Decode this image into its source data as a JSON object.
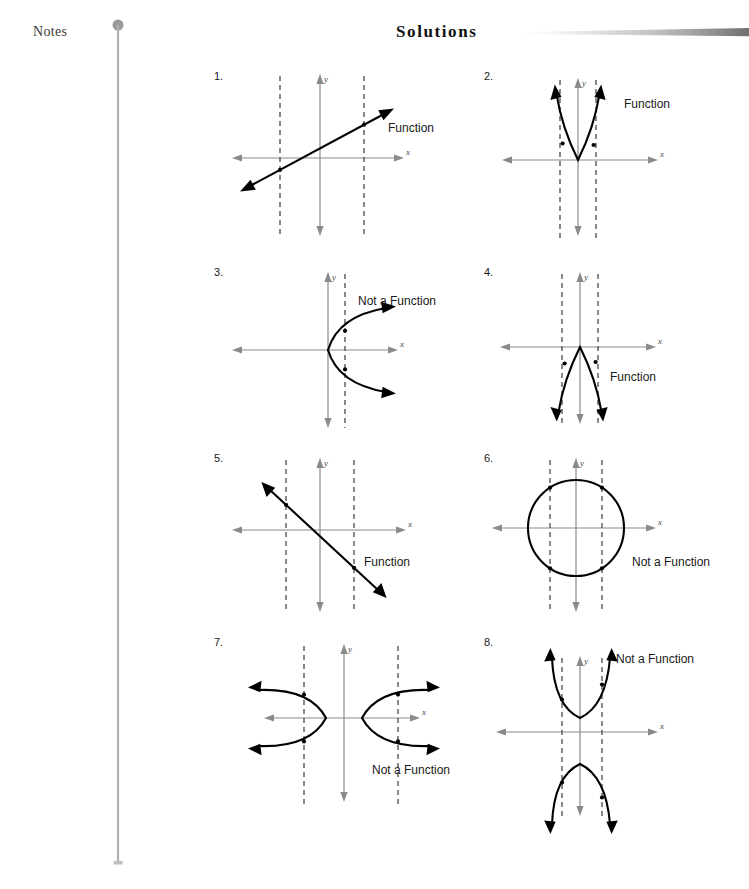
{
  "header": {
    "notes_label": "Notes",
    "title": "Solutions"
  },
  "margin_rule": {
    "color": "#9a9a9a"
  },
  "title_rule": {
    "color": "#8f8f8f"
  },
  "colors": {
    "axis": "#8a8a8a",
    "curve": "#000000",
    "test_line": "#4a4a4a",
    "text": "#1a1a1a"
  },
  "labels": {
    "x_axis": "x",
    "y_axis": "y",
    "function": "Function",
    "not_a_function": "Not a Function"
  },
  "problems": [
    {
      "number": "1.",
      "answer": "Function",
      "graph_type": "line-positive-slope",
      "test_lines": 2,
      "intersections_per_line": 1
    },
    {
      "number": "2.",
      "answer": "Function",
      "graph_type": "parabola-up",
      "test_lines": 2,
      "intersections_per_line": 1
    },
    {
      "number": "3.",
      "answer": "Not a Function",
      "graph_type": "parabola-right",
      "test_lines": 1,
      "intersections_per_line": 2
    },
    {
      "number": "4.",
      "answer": "Function",
      "graph_type": "parabola-down",
      "test_lines": 2,
      "intersections_per_line": 1
    },
    {
      "number": "5.",
      "answer": "Function",
      "graph_type": "line-negative-slope",
      "test_lines": 2,
      "intersections_per_line": 1
    },
    {
      "number": "6.",
      "answer": "Not a Function",
      "graph_type": "circle",
      "test_lines": 2,
      "intersections_per_line": 2
    },
    {
      "number": "7.",
      "answer": "Not a Function",
      "graph_type": "hyperbola-horizontal",
      "test_lines": 2,
      "intersections_per_line": 2
    },
    {
      "number": "8.",
      "answer": "Not a Function",
      "graph_type": "hyperbola-vertical",
      "test_lines": 2,
      "intersections_per_line": 2
    }
  ]
}
